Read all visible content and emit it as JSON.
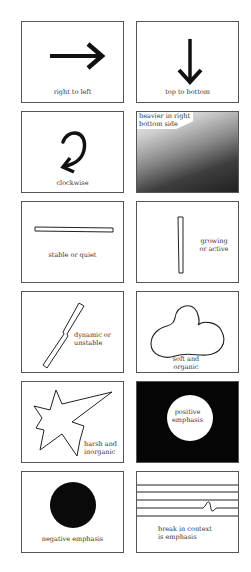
{
  "figure": {
    "title": "",
    "panels": [
      {
        "id": "p1",
        "label": "right to left",
        "graphic": "arrow-right-icon"
      },
      {
        "id": "p2",
        "label": "top to bottom",
        "graphic": "arrow-down-icon"
      },
      {
        "id": "p3",
        "label": "clockwise",
        "graphic": "clockwise-arrow-icon"
      },
      {
        "id": "p4",
        "label_line1": "heavier in right",
        "label_line2": "bottom side",
        "graphic": "gradient-fill"
      },
      {
        "id": "p5",
        "label": "stable or quiet",
        "graphic": "horizontal-bar"
      },
      {
        "id": "p6",
        "label_line1": "growing",
        "label_line2": "or active",
        "graphic": "vertical-bar"
      },
      {
        "id": "p7",
        "label_line1": "dynamic or",
        "label_line2": "unstable",
        "graphic": "diagonal-bar"
      },
      {
        "id": "p8",
        "label_line1": "soft and",
        "label_line2": "organic",
        "graphic": "blob-shape"
      },
      {
        "id": "p9",
        "label_line1": "harsh and",
        "label_line2": "inorganic",
        "graphic": "jagged-star-shape"
      },
      {
        "id": "p10",
        "label_line1": "positive",
        "label_line2": "emphasis",
        "graphic": "white-circle-on-black"
      },
      {
        "id": "p11",
        "label": "negative emphasis",
        "graphic": "black-circle"
      },
      {
        "id": "p12",
        "label_line1": "break in context",
        "label_line2": "is emphasis",
        "graphic": "lines-with-break"
      }
    ]
  },
  "colors": {
    "ink": "#111111",
    "border": "#555555",
    "background": "#ffffff",
    "dark_fill": "#050505"
  }
}
